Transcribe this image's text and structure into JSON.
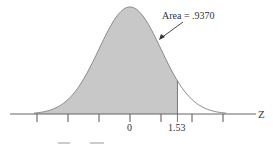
{
  "chart_data": {
    "type": "area",
    "title": "",
    "distribution": "standard normal",
    "annotation": "Area = .9370",
    "shaded_region": {
      "from": "-inf",
      "to": 1.53
    },
    "area": 0.937,
    "xlabel": "Z",
    "ylabel": "",
    "tick_labels": [
      {
        "value": 0,
        "label": "0"
      },
      {
        "value": 1.53,
        "label": "1.53"
      }
    ],
    "ticks": [
      -3,
      -2,
      -1,
      0,
      1,
      1.53,
      2,
      3
    ],
    "xlim": [
      -3.3,
      3.6
    ]
  },
  "labels": {
    "area": "Area = .9370",
    "axis": "Z",
    "zero": "0",
    "boundary": "1.53"
  },
  "colors": {
    "shade": "#c8c8c8",
    "curve": "#8a8a8a",
    "axis": "#555555"
  }
}
